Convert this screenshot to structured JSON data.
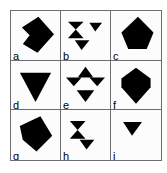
{
  "figure": {
    "type": "shape-grid-diagram",
    "rows": 3,
    "columns": 3,
    "border_color": "#6d6d6d",
    "shape_color": "#000000",
    "background_color": "#ffffff",
    "cells": [
      {
        "label": "a",
        "position": "row1-col1",
        "description": "large dark kite/diamond with a triangular notch cut into its left side",
        "shapes": [
          "notched-kite"
        ]
      },
      {
        "label": "b",
        "position": "row1-col2",
        "description": "bowtie/hourglass of two triangles upper-left, small downward triangle upper-right, downward triangle below the bowtie",
        "shapes": [
          "bowtie",
          "small-down-triangle",
          "down-triangle"
        ]
      },
      {
        "label": "c",
        "position": "row1-col3",
        "description": "irregular dark pentagon resembling a tilted diamond",
        "shapes": [
          "pentagon"
        ]
      },
      {
        "label": "d",
        "position": "row2-col1",
        "description": "large downward-pointing triangle",
        "shapes": [
          "down-triangle"
        ]
      },
      {
        "label": "e",
        "position": "row2-col2",
        "description": "upward triangle flanked by two downward triangles in a row, plus a downward triangle below",
        "shapes": [
          "up-triangle",
          "down-triangle-left",
          "down-triangle-right",
          "down-triangle-below"
        ]
      },
      {
        "label": "f",
        "position": "row2-col3",
        "description": "gem shaped hexagon, wide top tapering to a point at the bottom",
        "shapes": [
          "gem-hexagon"
        ]
      },
      {
        "label": "g",
        "position": "row3-col1",
        "description": "dark kite/diamond pointing right with a notch on the left",
        "shapes": [
          "kite"
        ]
      },
      {
        "label": "h",
        "position": "row3-col2",
        "description": "bowtie/hourglass of two triangles with a small downward triangle at lower right",
        "shapes": [
          "bowtie",
          "small-down-triangle"
        ]
      },
      {
        "label": "j",
        "position": "row3-col3",
        "description": "single small downward-pointing triangle",
        "shapes": [
          "small-down-triangle"
        ]
      }
    ]
  }
}
